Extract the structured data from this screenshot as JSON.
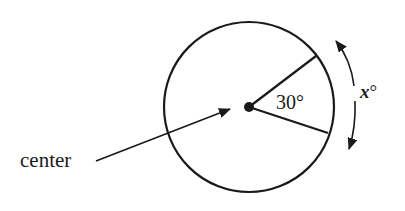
{
  "diagram": {
    "center_label": "center",
    "angle_label": "30°",
    "arc_label_var": "x",
    "arc_label_deg": "°",
    "colors": {
      "stroke": "#1a1a1a",
      "background": "#ffffff"
    }
  }
}
